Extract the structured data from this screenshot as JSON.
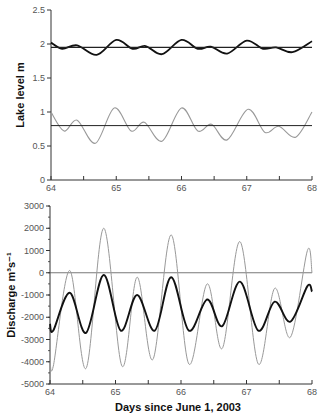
{
  "chart_data": [
    {
      "type": "line",
      "title": "",
      "xlabel": "",
      "ylabel": "Lake level  m",
      "xlim": [
        64,
        68
      ],
      "ylim": [
        0,
        2.5
      ],
      "xticks": [
        "64",
        "65",
        "66",
        "67",
        "68"
      ],
      "yticks": [
        "0",
        "0.5",
        "1",
        "1.5",
        "2",
        "2.5"
      ],
      "grid": false,
      "series": [
        {
          "name": "upper lake level (black)",
          "color": "#111111",
          "width": 1.8,
          "x": [
            64.0,
            64.17,
            64.4,
            64.7,
            65.0,
            65.25,
            65.45,
            65.7,
            66.0,
            66.25,
            66.45,
            66.7,
            67.0,
            67.25,
            67.45,
            67.7,
            68.0
          ],
          "y": [
            2.02,
            1.93,
            1.98,
            1.84,
            2.06,
            1.93,
            1.97,
            1.85,
            2.06,
            1.93,
            1.96,
            1.86,
            2.05,
            1.93,
            1.95,
            1.88,
            2.04
          ]
        },
        {
          "name": "upper mean level (line)",
          "color": "#222222",
          "width": 1.2,
          "x": [
            64,
            68
          ],
          "y": [
            1.95,
            1.95
          ]
        },
        {
          "name": "lower lake level (gray)",
          "color": "#999999",
          "width": 1.1,
          "x": [
            64.0,
            64.2,
            64.4,
            64.68,
            64.97,
            65.23,
            65.43,
            65.7,
            66.0,
            66.25,
            66.46,
            66.7,
            67.02,
            67.28,
            67.49,
            67.75,
            68.0
          ],
          "y": [
            1.0,
            0.72,
            0.88,
            0.54,
            1.06,
            0.72,
            0.85,
            0.57,
            1.06,
            0.72,
            0.82,
            0.59,
            1.04,
            0.7,
            0.79,
            0.63,
            1.0
          ]
        },
        {
          "name": "lower mean level (line)",
          "color": "#222222",
          "width": 1.0,
          "x": [
            64,
            68
          ],
          "y": [
            0.8,
            0.8
          ]
        }
      ]
    },
    {
      "type": "line",
      "title": "",
      "xlabel": "Days since June 1, 2003",
      "ylabel": "Discharge m³s⁻¹",
      "xlim": [
        64,
        68
      ],
      "ylim": [
        -5000,
        3000
      ],
      "xticks": [
        "64",
        "65",
        "66",
        "67",
        "68"
      ],
      "yticks": [
        "-5000",
        "-4000",
        "-3000",
        "-2000",
        "-1000",
        "0",
        "1000",
        "2000",
        "3000"
      ],
      "grid": false,
      "series": [
        {
          "name": "zero line",
          "color": "#555555",
          "width": 0.8,
          "x": [
            64,
            68
          ],
          "y": [
            0,
            0
          ]
        },
        {
          "name": "discharge (gray)",
          "color": "#999999",
          "width": 1.0,
          "x": [
            64.0,
            64.05,
            64.3,
            64.55,
            64.82,
            65.1,
            65.33,
            65.57,
            65.85,
            66.12,
            66.4,
            66.63,
            66.9,
            67.18,
            67.43,
            67.67,
            67.93,
            68.0
          ],
          "y": [
            -3800,
            -4200,
            100,
            -4300,
            2000,
            -4200,
            -200,
            -3900,
            1700,
            -4100,
            -500,
            -3400,
            1400,
            -4100,
            -700,
            -2900,
            1000,
            0
          ]
        },
        {
          "name": "discharge (black)",
          "color": "#111111",
          "width": 1.9,
          "x": [
            64.0,
            64.05,
            64.3,
            64.55,
            64.82,
            65.08,
            65.33,
            65.6,
            65.85,
            66.12,
            66.4,
            66.63,
            66.9,
            67.18,
            67.43,
            67.67,
            67.93,
            68.0
          ],
          "y": [
            -2300,
            -2600,
            -900,
            -2700,
            -100,
            -2600,
            -1000,
            -2600,
            -200,
            -2600,
            -1200,
            -2400,
            -400,
            -2600,
            -1300,
            -2200,
            -600,
            -850
          ]
        }
      ]
    }
  ],
  "labels": {
    "top_ylabel": "Lake level  m",
    "bottom_ylabel": "Discharge m³s⁻¹",
    "bottom_xlabel": "Days since June 1, 2003"
  }
}
